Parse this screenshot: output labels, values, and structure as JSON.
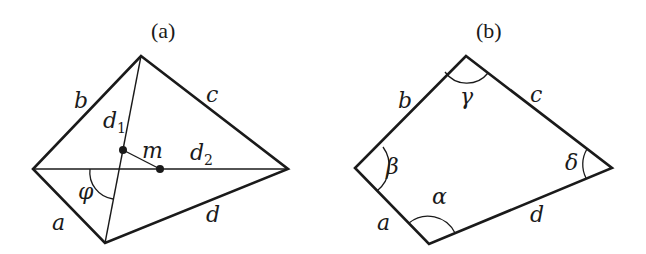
{
  "figure_a": {
    "title": "(a)",
    "sides": {
      "a": "a",
      "b": "b",
      "c": "c",
      "d": "d"
    },
    "diagonals": {
      "d1": "d",
      "d1_sub": "1",
      "d2": "d",
      "d2_sub": "2"
    },
    "midpoint_segment": "m",
    "angle": "φ"
  },
  "figure_b": {
    "title": "(b)",
    "sides": {
      "a": "a",
      "b": "b",
      "c": "c",
      "d": "d"
    },
    "angles": {
      "alpha": "α",
      "beta": "β",
      "gamma": "γ",
      "delta": "δ"
    }
  }
}
